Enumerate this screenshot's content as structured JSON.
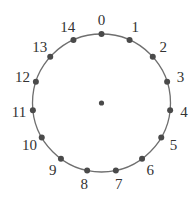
{
  "diagram": {
    "type": "circular-node-ring",
    "center": {
      "x": 101.5,
      "y": 103
    },
    "radius": 69,
    "circle_color": "#6f6f6f",
    "dot_color": "#4a4a4a",
    "center_dot": true,
    "nodes": [
      {
        "label": "0"
      },
      {
        "label": "1"
      },
      {
        "label": "2"
      },
      {
        "label": "3"
      },
      {
        "label": "4"
      },
      {
        "label": "5"
      },
      {
        "label": "6"
      },
      {
        "label": "7"
      },
      {
        "label": "8"
      },
      {
        "label": "9"
      },
      {
        "label": "10"
      },
      {
        "label": "11"
      },
      {
        "label": "12"
      },
      {
        "label": "13"
      },
      {
        "label": "14"
      }
    ]
  }
}
